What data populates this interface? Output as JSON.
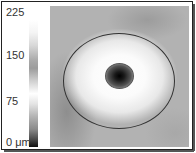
{
  "colorbar": {
    "unit": "μm",
    "ticks": [
      "225",
      "150",
      "75",
      "0 μm"
    ],
    "range": [
      0,
      225
    ]
  },
  "map": {
    "description": "retinal thickness map with central fovea",
    "outer_ring": "ellipse",
    "inner_ring": "ellipse"
  }
}
